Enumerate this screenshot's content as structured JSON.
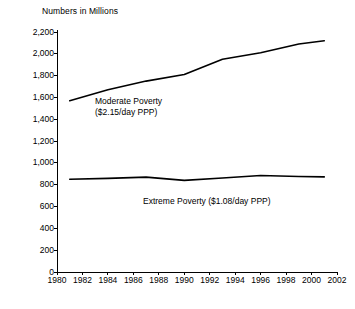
{
  "chart_data": {
    "type": "line",
    "title": "Numbers in Millions",
    "xlabel": "",
    "ylabel": "",
    "xlim": [
      1980,
      2002
    ],
    "ylim": [
      0,
      2200
    ],
    "grid": false,
    "legend_position": "inline-annotation",
    "xticks": [
      "1980",
      "1982",
      "1984",
      "1986",
      "1988",
      "1990",
      "1992",
      "1994",
      "1996",
      "1998",
      "2000",
      "2002"
    ],
    "xtick_values": [
      1980,
      1982,
      1984,
      1986,
      1988,
      1990,
      1992,
      1994,
      1996,
      1998,
      2000,
      2002
    ],
    "yticks": [
      "0",
      "200",
      "400",
      "600",
      "800",
      "1,000",
      "1,200",
      "1,400",
      "1,600",
      "1,800",
      "2,000",
      "2,200"
    ],
    "ytick_values": [
      0,
      200,
      400,
      600,
      800,
      1000,
      1200,
      1400,
      1600,
      1800,
      2000,
      2200
    ],
    "x": [
      1981,
      1984,
      1987,
      1990,
      1993,
      1996,
      1999,
      2001
    ],
    "series": [
      {
        "name": "Moderate Poverty ($2.15/day PPP)",
        "label_line1": "Moderate Poverty",
        "label_line2": "($2.15/day PPP)",
        "color": "#000000",
        "values": [
          1570,
          1670,
          1750,
          1810,
          1950,
          2010,
          2090,
          2120
        ]
      },
      {
        "name": "Extreme Poverty ($1.08/day PPP)",
        "label_line1": "Extreme Poverty ($1.08/day PPP)",
        "label_line2": "",
        "color": "#000000",
        "values": [
          850,
          858,
          870,
          840,
          862,
          885,
          875,
          872
        ]
      }
    ]
  },
  "annotations": {
    "moderate_label_line1": "Moderate Poverty",
    "moderate_label_line2": "($2.15/day PPP)",
    "extreme_label": "Extreme Poverty ($1.08/day PPP)"
  }
}
